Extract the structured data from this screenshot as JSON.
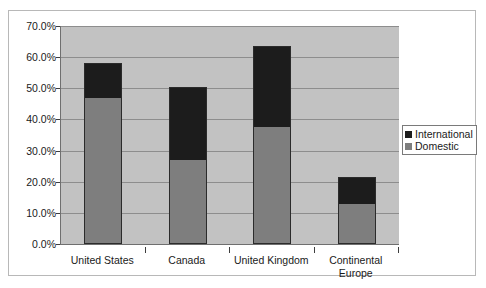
{
  "chart_data": {
    "type": "bar",
    "subtype": "stacked-bar",
    "title": "",
    "xlabel": "",
    "ylabel": "",
    "categories": [
      "United States",
      "Canada",
      "United Kingdom",
      "Continental Europe"
    ],
    "series": [
      {
        "name": "Domestic",
        "color": "#7e7e7e",
        "values": [
          47.0,
          27.0,
          37.5,
          13.0
        ]
      },
      {
        "name": "International",
        "color": "#1c1c1c",
        "values": [
          11.0,
          23.5,
          26.0,
          8.5
        ]
      }
    ],
    "totals": [
      58.0,
      50.5,
      63.5,
      21.5
    ],
    "ylim": [
      0,
      70
    ],
    "ytick_step": 10,
    "ytick_labels": [
      "0.0%",
      "10.0%",
      "20.0%",
      "30.0%",
      "40.0%",
      "50.0%",
      "60.0%",
      "70.0%"
    ],
    "ytick_values": [
      0,
      10,
      20,
      30,
      40,
      50,
      60,
      70
    ],
    "grid": true,
    "grid_axis": "y",
    "legend_position": "right",
    "legend_entries": [
      "International",
      "Domestic"
    ],
    "plot_background": "#c2c2c2",
    "frame_background": "#ffffff"
  },
  "axis": {
    "y_labels": [
      "70.0%",
      "60.0%",
      "50.0%",
      "40.0%",
      "30.0%",
      "20.0%",
      "10.0%",
      "0.0%"
    ],
    "x_labels": [
      "United States",
      "Canada",
      "United Kingdom",
      "Continental Europe"
    ]
  },
  "legend": {
    "items": [
      {
        "label": "International",
        "color": "#1c1c1c"
      },
      {
        "label": "Domestic",
        "color": "#7e7e7e"
      }
    ]
  }
}
